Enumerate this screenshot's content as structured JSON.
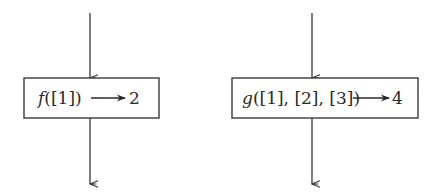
{
  "colors": {
    "stroke": "#3a3a3a",
    "text": "#2a2a2a",
    "background": "#ffffff"
  },
  "nodes": [
    {
      "id": "f-box",
      "function_name": "f",
      "arguments": "([1])",
      "arrow": "→",
      "result": "2"
    },
    {
      "id": "g-box",
      "function_name": "g",
      "arguments": "([1], [2], [3])",
      "arrow": "→",
      "result": "4"
    }
  ]
}
